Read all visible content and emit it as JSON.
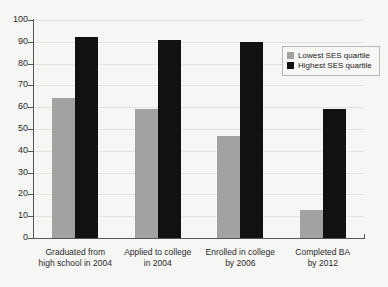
{
  "chart_data": {
    "type": "bar",
    "title": "",
    "xlabel": "",
    "ylabel": "",
    "ylim": [
      0,
      100
    ],
    "yticks": [
      0,
      10,
      20,
      30,
      40,
      50,
      60,
      70,
      80,
      90,
      100
    ],
    "grid": true,
    "legend_position": "top-right",
    "categories": [
      "Graduated from high school in 2004",
      "Applied to college in 2004",
      "Enrolled in college by 2006",
      "Completed BA by 2012"
    ],
    "category_lines": [
      [
        "Graduated from",
        "high school in 2004"
      ],
      [
        "Applied to college",
        "in 2004"
      ],
      [
        "Enrolled in college",
        "by 2006"
      ],
      [
        "Completed BA",
        "by 2012"
      ]
    ],
    "series": [
      {
        "name": "Lowest SES quartile",
        "color": "#a2a2a2",
        "values": [
          64,
          59,
          47,
          13
        ]
      },
      {
        "name": "Highest SES quartile",
        "color": "#111111",
        "values": [
          92,
          91,
          90,
          59
        ]
      }
    ]
  },
  "legend": {
    "items": [
      {
        "label": "Lowest SES quartile",
        "color": "#a2a2a2"
      },
      {
        "label": "Highest SES quartile",
        "color": "#111111"
      }
    ]
  },
  "colors": {
    "background": "#f6f6f4",
    "axis": "#55555a",
    "grid": "#e2e2de",
    "low_ses": "#a2a2a2",
    "high_ses": "#111111"
  }
}
